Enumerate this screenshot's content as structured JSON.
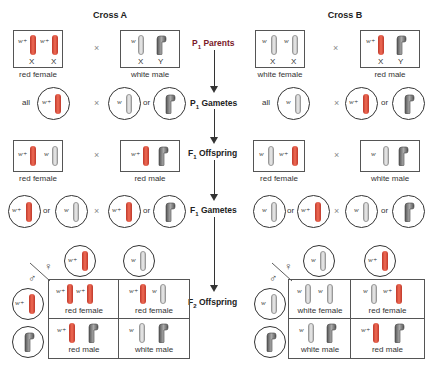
{
  "cross_a": {
    "title": "Cross A",
    "p1_parents": {
      "female": {
        "caption": "red female",
        "alleles": [
          "w+",
          "w+"
        ],
        "chromosomes": [
          "X",
          "X"
        ]
      },
      "male": {
        "caption": "white male",
        "alleles": [
          "w",
          ""
        ],
        "chromosomes": [
          "X",
          "Y"
        ]
      }
    },
    "p1_gametes": {
      "female_prefix": "all",
      "female": [
        "w+"
      ],
      "male": [
        "w",
        "Y"
      ],
      "or": "or"
    },
    "f1_offspring": {
      "female": {
        "caption": "red female",
        "alleles": [
          "w+",
          "w"
        ]
      },
      "male": {
        "caption": "red male",
        "alleles": [
          "w+",
          ""
        ]
      }
    },
    "f1_gametes": {
      "female": [
        "w+",
        "w"
      ],
      "male": [
        "w+",
        "Y"
      ],
      "or": "or"
    },
    "f2_punnett": {
      "female_gametes": [
        "w+",
        "w"
      ],
      "male_gametes": [
        "w+",
        "Y"
      ],
      "cells": [
        {
          "alleles": [
            "w+",
            "w+"
          ],
          "caption": "red female"
        },
        {
          "alleles": [
            "w+",
            "w"
          ],
          "caption": "red female"
        },
        {
          "alleles": [
            "w+",
            ""
          ],
          "caption": "red male"
        },
        {
          "alleles": [
            "w",
            ""
          ],
          "caption": "white male"
        }
      ]
    }
  },
  "cross_b": {
    "title": "Cross B",
    "p1_parents": {
      "female": {
        "caption": "white female",
        "alleles": [
          "w",
          "w"
        ],
        "chromosomes": [
          "X",
          "X"
        ]
      },
      "male": {
        "caption": "red male",
        "alleles": [
          "w+",
          ""
        ],
        "chromosomes": [
          "X",
          "Y"
        ]
      }
    },
    "p1_gametes": {
      "female_prefix": "all",
      "female": [
        "w"
      ],
      "male": [
        "w+",
        "Y"
      ],
      "or": "or"
    },
    "f1_offspring": {
      "female": {
        "caption": "red female",
        "alleles": [
          "w",
          "w+"
        ]
      },
      "male": {
        "caption": "white male",
        "alleles": [
          "w",
          ""
        ]
      }
    },
    "f1_gametes": {
      "female": [
        "w",
        "w+"
      ],
      "male": [
        "w",
        "Y"
      ],
      "or": "or"
    },
    "f2_punnett": {
      "female_gametes": [
        "w",
        "w+"
      ],
      "male_gametes": [
        "w",
        "Y"
      ],
      "cells": [
        {
          "alleles": [
            "w",
            "w"
          ],
          "caption": "white female"
        },
        {
          "alleles": [
            "w",
            "w+"
          ],
          "caption": "red female"
        },
        {
          "alleles": [
            "w",
            ""
          ],
          "caption": "white male"
        },
        {
          "alleles": [
            "w+",
            ""
          ],
          "caption": "red male"
        }
      ]
    }
  },
  "stages": [
    {
      "main": "P",
      "sub": "1",
      "rest": " Parents",
      "color": "#7a1a2a"
    },
    {
      "main": "P",
      "sub": "1",
      "rest": " Gametes",
      "color": "#222222"
    },
    {
      "main": "F",
      "sub": "1",
      "rest": " Offspring",
      "color": "#222222"
    },
    {
      "main": "F",
      "sub": "1",
      "rest": " Gametes",
      "color": "#222222"
    },
    {
      "main": "F",
      "sub": "2",
      "rest": " Offspring",
      "color": "#222222"
    }
  ],
  "symbols": {
    "times": "×",
    "female": "♀",
    "male": "♂"
  },
  "colors": {
    "red_chromosome": "#e05a45",
    "white_chromosome": "#dddddd",
    "y_chromosome": "#777777"
  }
}
